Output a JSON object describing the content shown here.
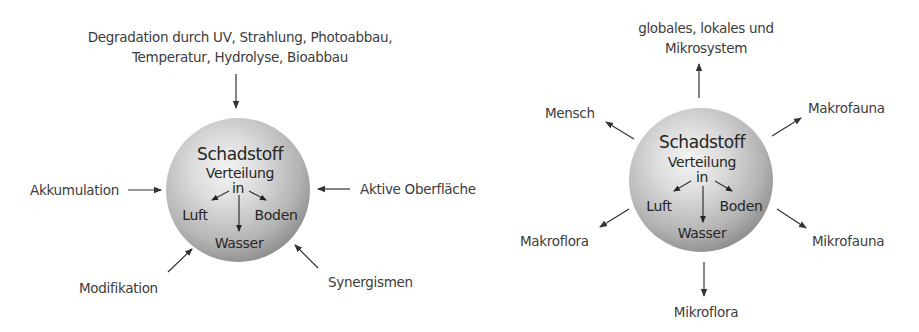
{
  "diagram_left": {
    "sphere": {
      "title": "Schadstoff",
      "line2": "Verteilung",
      "line3": "in",
      "compartments": [
        "Luft",
        "Boden",
        "Wasser"
      ]
    },
    "top_label": {
      "line1": "Degradation durch UV, Strahlung, Photoabbau,",
      "line2": "Temperatur, Hydrolyse, Bioabbau"
    },
    "left_label": "Akkumulation",
    "right_label": "Aktive Oberfläche",
    "bottom_left_label": "Modifikation",
    "bottom_right_label": "Synergismen",
    "arrow_direction": "inward"
  },
  "diagram_right": {
    "sphere": {
      "title": "Schadstoff",
      "line2": "Verteilung",
      "line3": "in",
      "compartments": [
        "Luft",
        "Boden",
        "Wasser"
      ]
    },
    "top_label": {
      "line1": "globales, lokales und",
      "line2": "Mikrosystem"
    },
    "upper_left_label": "Mensch",
    "upper_right_label": "Makrofauna",
    "lower_left_label": "Makroflora",
    "lower_right_label": "Mikrofauna",
    "bottom_label": "Mikroflora",
    "arrow_direction": "outward"
  },
  "colors": {
    "sphere_light": "#f2f2f2",
    "sphere_mid": "#b8b8b8",
    "sphere_dark": "#7d7d7d",
    "text": "#3c3c3c",
    "arrow": "#333333"
  }
}
